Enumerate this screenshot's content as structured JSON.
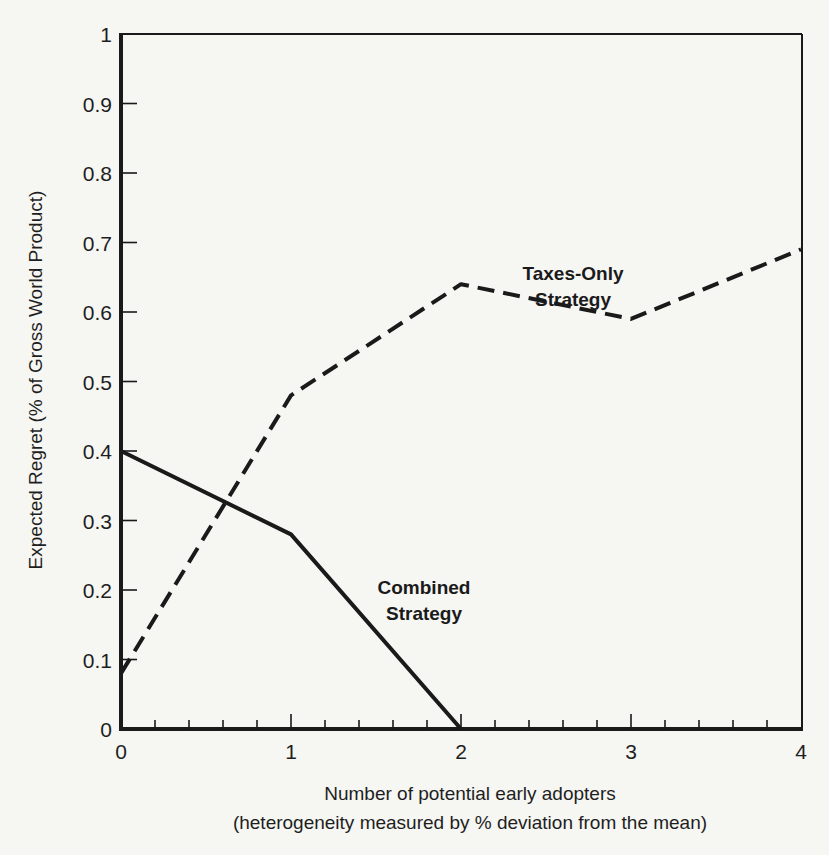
{
  "chart_data": {
    "type": "line",
    "title": "",
    "xlabel": "Number of potential early adopters",
    "xlabel_line2": "(heterogeneity measured by % deviation from the mean)",
    "ylabel": "Expected Regret (% of Gross World Product)",
    "xlim": [
      0,
      4
    ],
    "ylim": [
      0,
      1
    ],
    "x_ticks": [
      "0",
      "1",
      "2",
      "3",
      "4"
    ],
    "x_minor_tick_step": 0.2,
    "y_ticks": [
      "0",
      "0.1",
      "0.2",
      "0.3",
      "0.4",
      "0.5",
      "0.6",
      "0.7",
      "0.8",
      "0.9",
      "1"
    ],
    "grid": false,
    "legend": "inline labels",
    "series": [
      {
        "name": "Taxes-Only Strategy",
        "label_line1": "Taxes-Only",
        "label_line2": "Strategy",
        "style": "dashed",
        "x": [
          0,
          1,
          2,
          3,
          4
        ],
        "values": [
          0.08,
          0.48,
          0.64,
          0.59,
          0.69
        ]
      },
      {
        "name": "Combined Strategy",
        "label_line1": "Combined",
        "label_line2": "Strategy",
        "style": "solid",
        "x": [
          0,
          1,
          2
        ],
        "values": [
          0.4,
          0.28,
          0.0
        ]
      }
    ]
  },
  "colors": {
    "background": "#f6f6f3",
    "ink": "#1a1a1a"
  }
}
